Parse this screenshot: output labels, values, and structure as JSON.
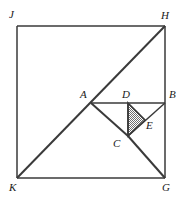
{
  "figure": {
    "type": "geometry-diagram",
    "shape": "square with inscribed diagonals and shaded triangle",
    "stroke_color": "#3a3a3a",
    "shaded_fill_color": "#9a9a9a",
    "background_color": "#ffffff",
    "labels": {
      "J": "J",
      "H": "H",
      "A": "A",
      "D": "D",
      "B": "B",
      "E": "E",
      "C": "C",
      "K": "K",
      "G": "G"
    },
    "points": {
      "J": {
        "x": 17,
        "y": 26
      },
      "H": {
        "x": 165,
        "y": 26
      },
      "K": {
        "x": 17,
        "y": 178
      },
      "G": {
        "x": 165,
        "y": 178
      },
      "A": {
        "x": 91,
        "y": 103
      },
      "B": {
        "x": 165,
        "y": 103
      },
      "D": {
        "x": 128,
        "y": 103
      },
      "C": {
        "x": 128,
        "y": 136
      },
      "E": {
        "x": 145,
        "y": 120
      }
    },
    "label_positions": {
      "J": {
        "x": 9,
        "y": 9
      },
      "H": {
        "x": 161,
        "y": 10
      },
      "A": {
        "x": 80,
        "y": 89
      },
      "D": {
        "x": 122,
        "y": 89
      },
      "B": {
        "x": 169,
        "y": 89
      },
      "E": {
        "x": 146,
        "y": 120
      },
      "C": {
        "x": 113,
        "y": 138
      },
      "K": {
        "x": 9,
        "y": 182
      },
      "G": {
        "x": 162,
        "y": 182
      }
    },
    "segments": [
      {
        "name": "square-top-JH",
        "from": "J",
        "to": "H"
      },
      {
        "name": "square-right-HG",
        "from": "H",
        "to": "G"
      },
      {
        "name": "square-bottom-KG",
        "from": "K",
        "to": "G"
      },
      {
        "name": "square-left-JK",
        "from": "J",
        "to": "K"
      },
      {
        "name": "diagonal-KH",
        "from": "K",
        "to": "H"
      },
      {
        "name": "segment-AB",
        "from": "A",
        "to": "B"
      },
      {
        "name": "segment-AC",
        "from": "A",
        "to": "C"
      },
      {
        "name": "segment-CG",
        "from": "C",
        "to": "G"
      },
      {
        "name": "segment-BC",
        "from": "B",
        "to": "C"
      },
      {
        "name": "segment-DC",
        "from": "D",
        "to": "C"
      }
    ],
    "shaded_triangle": {
      "vertices": [
        "D",
        "E",
        "C"
      ]
    }
  }
}
